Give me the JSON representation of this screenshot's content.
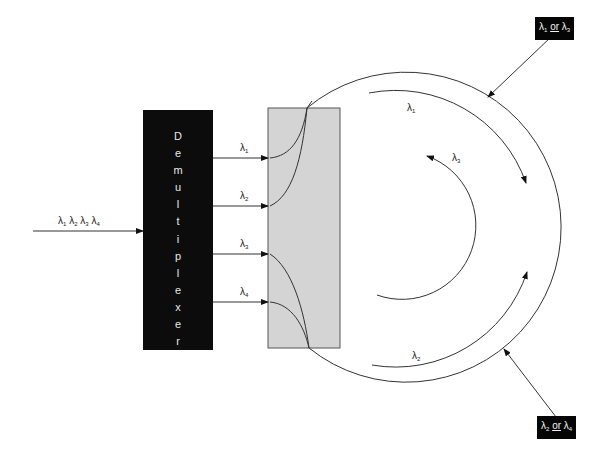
{
  "diagram": {
    "input": {
      "label": [
        "λ1",
        "λ2",
        "λ3",
        "λ4"
      ]
    },
    "demultiplexer": {
      "label": "Demultiplexer",
      "letters": [
        "D",
        "e",
        "m",
        "u",
        "l",
        "t",
        "i",
        "p",
        "l",
        "e",
        "x",
        "e",
        "r"
      ]
    },
    "channels": [
      {
        "id": "lambda1",
        "symbol": "λ",
        "sub": "1"
      },
      {
        "id": "lambda2",
        "symbol": "λ",
        "sub": "2"
      },
      {
        "id": "lambda3",
        "symbol": "λ",
        "sub": "3"
      },
      {
        "id": "lambda4",
        "symbol": "λ",
        "sub": "4"
      }
    ],
    "ring_labels": {
      "top_arc": {
        "symbol": "λ",
        "sub": "1"
      },
      "inner_arc": {
        "symbol": "λ",
        "sub": "3"
      },
      "bottom_arc": {
        "symbol": "λ",
        "sub": "2"
      }
    },
    "tags": {
      "top": {
        "a_sym": "λ",
        "a_sub": "1",
        "or": "or",
        "b_sym": "λ",
        "b_sub": "3"
      },
      "bottom": {
        "a_sym": "λ",
        "a_sub": "2",
        "or": "or",
        "b_sym": "λ",
        "b_sub": "4"
      }
    },
    "colors": {
      "line": "#333333",
      "demux_fill": "#0c0c0c",
      "coupler_fill": "#d4d4d4",
      "coupler_border": "#555555"
    }
  }
}
